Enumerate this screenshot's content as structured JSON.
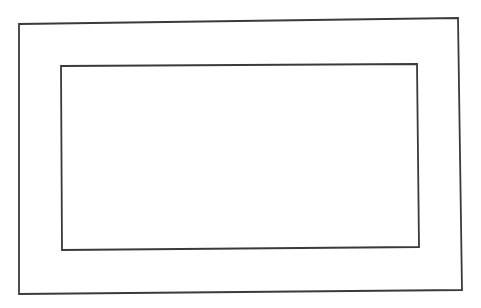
{
  "canvas": {
    "width": 481,
    "height": 308,
    "background_color": "#ffffff",
    "title": "Nested rectangles line drawing"
  },
  "style": {
    "stroke_color": "#3a3a3a",
    "stroke_width": 1.8,
    "fill": "none"
  },
  "shapes": [
    {
      "name": "outer-rectangle",
      "type": "quadrilateral",
      "points": "19,24 458,18 462,290 19,294",
      "stroke_color": "#3a3a3a",
      "stroke_width": 1.8,
      "fill": "none"
    },
    {
      "name": "inner-rectangle",
      "type": "quadrilateral",
      "points": "61,66 417,64 419,247 62,250",
      "stroke_color": "#3a3a3a",
      "stroke_width": 1.8,
      "fill": "none"
    }
  ]
}
